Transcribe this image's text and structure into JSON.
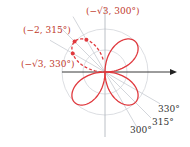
{
  "figure": {
    "equation": "r = 2 sin 2θ",
    "points": [
      {
        "label": "(−2, 315°)",
        "r": -2,
        "theta_deg": 315
      },
      {
        "label": "(−√3, 300°)",
        "r": -1.732,
        "theta_deg": 300
      },
      {
        "label": "(−√3, 330°)",
        "r": -1.732,
        "theta_deg": 330
      }
    ],
    "ray_labels": [
      "330°",
      "315°",
      "300°"
    ],
    "colors": {
      "curve": "#e0393e",
      "grid": "#c8ccd2",
      "axis": "#222222",
      "label": "#c0392b"
    }
  }
}
